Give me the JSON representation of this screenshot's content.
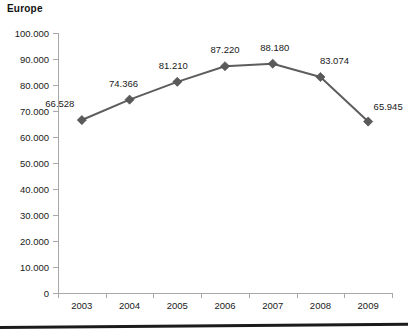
{
  "chart_data": {
    "type": "line",
    "title": "Europe",
    "xlabel": "",
    "ylabel": "",
    "categories": [
      "2003",
      "2004",
      "2005",
      "2006",
      "2007",
      "2008",
      "2009"
    ],
    "values": [
      66528,
      74366,
      81210,
      87220,
      88180,
      83074,
      65945
    ],
    "point_labels": [
      "66.528",
      "74.366",
      "81.210",
      "87.220",
      "88.180",
      "83.074",
      "65.945"
    ],
    "series": [
      {
        "name": "Europe",
        "values": [
          66528,
          74366,
          81210,
          87220,
          88180,
          83074,
          65945
        ],
        "color": "#5d5d5d",
        "marker": "diamond"
      }
    ],
    "ylim": [
      0,
      100000
    ],
    "ytick_values": [
      0,
      10000,
      20000,
      30000,
      40000,
      50000,
      60000,
      70000,
      80000,
      90000,
      100000
    ],
    "ytick_labels": [
      "0",
      "10.000",
      "20.000",
      "30.000",
      "40.000",
      "50.000",
      "60.000",
      "70.000",
      "80.000",
      "90.000",
      "100.000"
    ],
    "grid": false,
    "legend": false,
    "legend_position": "none",
    "data_labels_shown": true,
    "axis_color": "#a8a8a8",
    "text_color": "#1a1a1a"
  }
}
